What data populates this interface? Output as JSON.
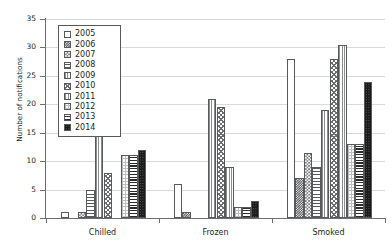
{
  "chart_data": {
    "type": "bar",
    "title": "",
    "xlabel": "",
    "ylabel": "Number of notifications",
    "ylim": [
      0,
      35
    ],
    "ytick_values": [
      0,
      5,
      10,
      15,
      20,
      25,
      30,
      35
    ],
    "ytick_labels": [
      "0",
      "5",
      "10",
      "15",
      "20",
      "25",
      "30",
      "35"
    ],
    "grid": "horizontal",
    "legend_position": "upper-left-inside",
    "categories": [
      "Chilled",
      "Frozen",
      "Smoked"
    ],
    "series": [
      {
        "name": "2005",
        "values": [
          1,
          6,
          28
        ]
      },
      {
        "name": "2006",
        "values": [
          0,
          1,
          7
        ]
      },
      {
        "name": "2007",
        "values": [
          1,
          0,
          11.5
        ]
      },
      {
        "name": "2008",
        "values": [
          5,
          0,
          9
        ]
      },
      {
        "name": "2009",
        "values": [
          19,
          21,
          19
        ]
      },
      {
        "name": "2010",
        "values": [
          8,
          19.5,
          28
        ]
      },
      {
        "name": "2011",
        "values": [
          0,
          9,
          30.5
        ]
      },
      {
        "name": "2012",
        "values": [
          11,
          2,
          13
        ]
      },
      {
        "name": "2013",
        "values": [
          11,
          2,
          13
        ]
      },
      {
        "name": "2014",
        "values": [
          12,
          3,
          24
        ]
      }
    ]
  },
  "legend": {
    "items": [
      {
        "label": "2005",
        "pattern": "open-white"
      },
      {
        "label": "2006",
        "pattern": "dark-checker"
      },
      {
        "label": "2007",
        "pattern": "diagonal-checker"
      },
      {
        "label": "2008",
        "pattern": "horizontal-lines"
      },
      {
        "label": "2009",
        "pattern": "vertical-fine-lines"
      },
      {
        "label": "2010",
        "pattern": "crosshatch-diagonal"
      },
      {
        "label": "2011",
        "pattern": "vertical-lines-grid"
      },
      {
        "label": "2012",
        "pattern": "light-grid-dots"
      },
      {
        "label": "2013",
        "pattern": "bold-horizontal-lines"
      },
      {
        "label": "2014",
        "pattern": "solid-black"
      }
    ]
  },
  "colors": {
    "axis": "#6d6e71",
    "grid": "#d9d9d9",
    "text": "#231f20",
    "background": "#ffffff"
  }
}
